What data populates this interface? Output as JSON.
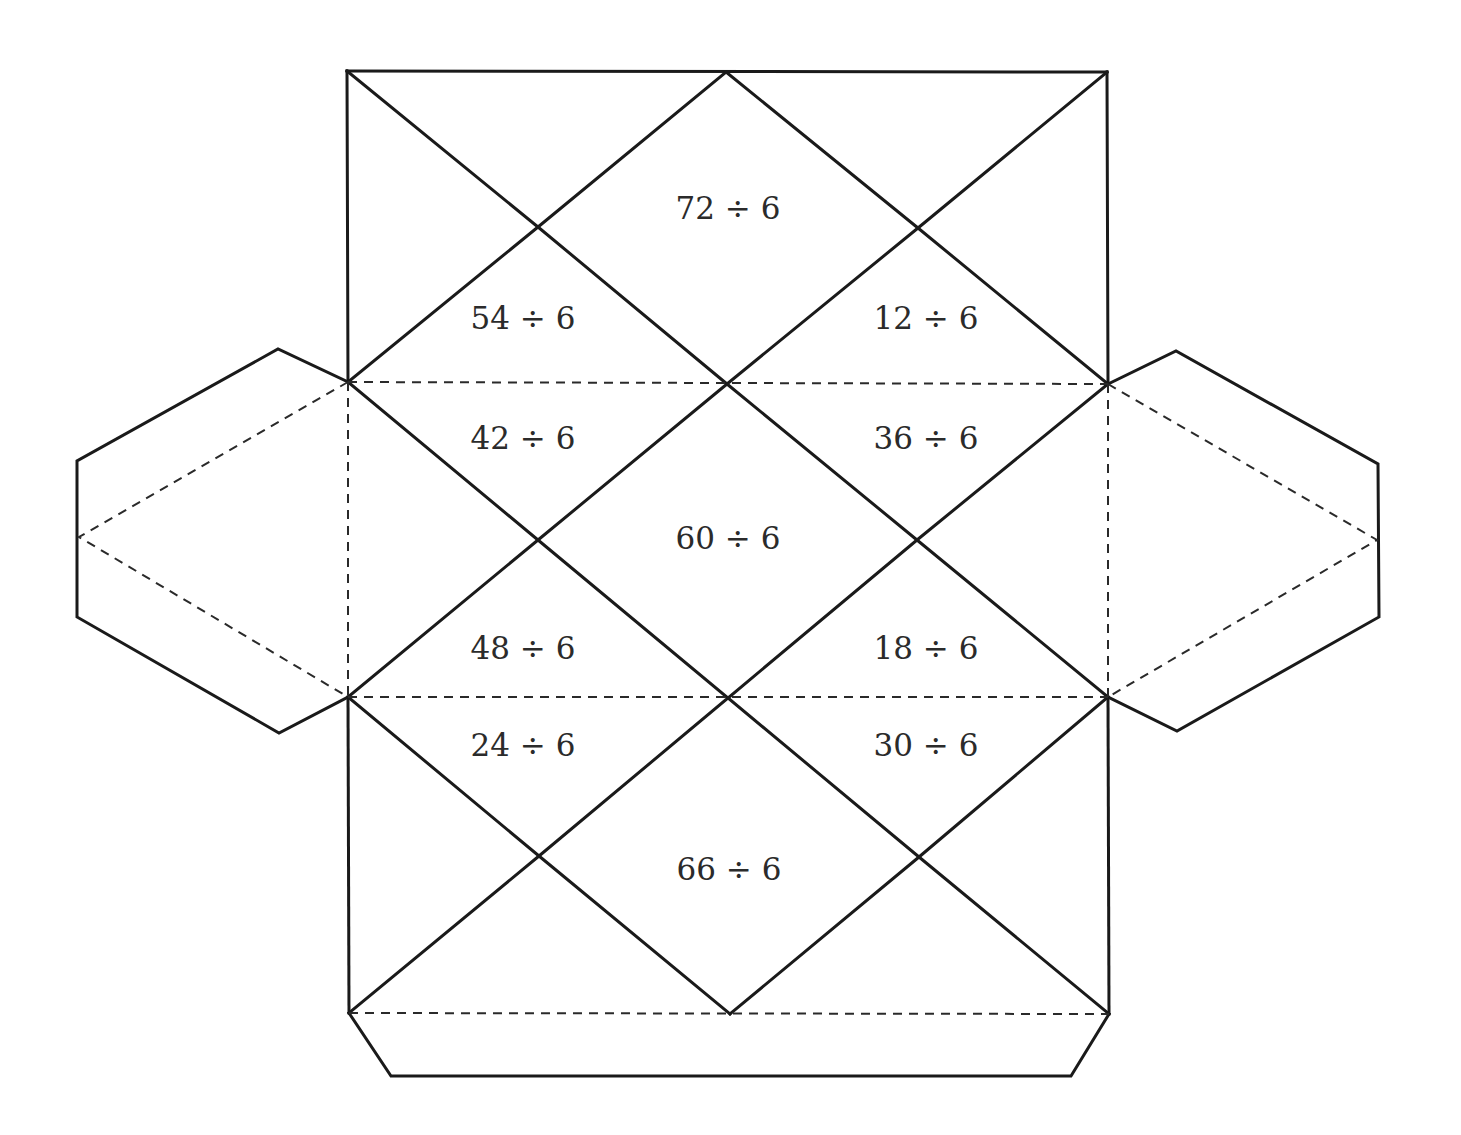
{
  "diagram": {
    "type": "octahedron-net-worksheet",
    "colors": {
      "line": "#1a1a1a",
      "text": "#2b2b2b",
      "background": "#ffffff"
    },
    "faces": [
      {
        "id": "top-center",
        "label": "72 ÷ 6",
        "x": 728,
        "y": 208
      },
      {
        "id": "upper-left",
        "label": "54 ÷ 6",
        "x": 523,
        "y": 318
      },
      {
        "id": "upper-right",
        "label": "12 ÷ 6",
        "x": 926,
        "y": 318
      },
      {
        "id": "mid-upper-left",
        "label": "42 ÷ 6",
        "x": 523,
        "y": 438
      },
      {
        "id": "mid-upper-right",
        "label": "36 ÷ 6",
        "x": 926,
        "y": 438
      },
      {
        "id": "center",
        "label": "60 ÷ 6",
        "x": 728,
        "y": 538
      },
      {
        "id": "mid-lower-left",
        "label": "48 ÷ 6",
        "x": 523,
        "y": 648
      },
      {
        "id": "mid-lower-right",
        "label": "18 ÷ 6",
        "x": 926,
        "y": 648
      },
      {
        "id": "lower-left",
        "label": "24 ÷ 6",
        "x": 523,
        "y": 745
      },
      {
        "id": "lower-right",
        "label": "30 ÷ 6",
        "x": 926,
        "y": 745
      },
      {
        "id": "bottom-center",
        "label": "66 ÷ 6",
        "x": 729,
        "y": 869
      }
    ]
  }
}
